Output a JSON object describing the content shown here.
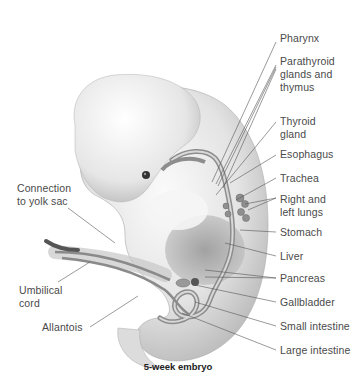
{
  "figure": {
    "caption": "5-week embryo",
    "labels_right": [
      {
        "id": "pharynx",
        "text": "Pharynx",
        "x": 280,
        "y": 38
      },
      {
        "id": "parathyroid",
        "text": "Parathyroid\nglands and\nthymus",
        "x": 280,
        "y": 60
      },
      {
        "id": "thyroid",
        "text": "Thyroid\ngland",
        "x": 280,
        "y": 115
      },
      {
        "id": "esophagus",
        "text": "Esophagus",
        "x": 280,
        "y": 148
      },
      {
        "id": "trachea",
        "text": "Trachea",
        "x": 280,
        "y": 172
      },
      {
        "id": "lungs",
        "text": "Right and\nleft lungs",
        "x": 280,
        "y": 193
      },
      {
        "id": "stomach",
        "text": "Stomach",
        "x": 280,
        "y": 225
      },
      {
        "id": "liver",
        "text": "Liver",
        "x": 280,
        "y": 248
      },
      {
        "id": "pancreas",
        "text": "Pancreas",
        "x": 280,
        "y": 270
      },
      {
        "id": "gallbladder",
        "text": "Gallbladder",
        "x": 280,
        "y": 295
      },
      {
        "id": "small-intestine",
        "text": "Small intestine",
        "x": 280,
        "y": 319
      },
      {
        "id": "large-intestine",
        "text": "Large intestine",
        "x": 280,
        "y": 343
      }
    ],
    "labels_left": [
      {
        "id": "yolk-sac",
        "text": "Connection\nto yolk sac",
        "x": 16,
        "y": 182
      },
      {
        "id": "umbilical-cord",
        "text": "Umbilical\ncord",
        "x": 18,
        "y": 280
      },
      {
        "id": "allantois",
        "text": "Allantois",
        "x": 42,
        "y": 320
      }
    ],
    "colors": {
      "text": "#4a4a4a",
      "leader_line": "#555555",
      "body_fill": "#e8e8e8",
      "organ_fill": "#9a9a9a"
    }
  }
}
